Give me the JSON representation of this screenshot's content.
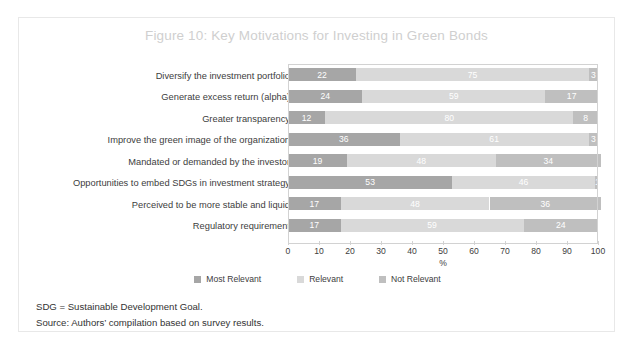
{
  "figure": {
    "title": "Figure 10: Key Motivations for Investing in Green Bonds",
    "title_color": "#cfcfcf",
    "notes": [
      "SDG = Sustainable Development Goal.",
      "Source: Authors’ compilation based on survey results."
    ]
  },
  "chart_data": {
    "type": "bar",
    "orientation": "horizontal",
    "stacked": true,
    "stack_total": 100,
    "title": "Figure 10: Key Motivations for Investing in Green Bonds",
    "xlabel": "%",
    "ylabel": "",
    "xlim": [
      0,
      100
    ],
    "xticks": [
      0,
      10,
      20,
      30,
      40,
      50,
      60,
      70,
      80,
      90,
      100
    ],
    "grid": false,
    "legend_position": "bottom",
    "categories": [
      "Diversify the investment portfolio",
      "Generate excess return (alpha)",
      "Greater transparency",
      "Improve the green image of the organization",
      "Mandated or demanded by the investor",
      "Opportunities to embed SDGs in investment strategy",
      "Perceived to be more stable and liquid",
      "Regulatory requirement"
    ],
    "series": [
      {
        "name": "Most Relevant",
        "color": "#a6a6a6",
        "values": [
          22,
          24,
          12,
          36,
          19,
          53,
          17,
          17
        ]
      },
      {
        "name": "Relevant",
        "color": "#d9d9d9",
        "values": [
          75,
          59,
          80,
          61,
          48,
          46,
          48,
          59
        ]
      },
      {
        "name": "Not Relevant",
        "color": "#bfbfbf",
        "values": [
          3,
          17,
          8,
          3,
          34,
          1,
          36,
          24
        ]
      }
    ]
  }
}
